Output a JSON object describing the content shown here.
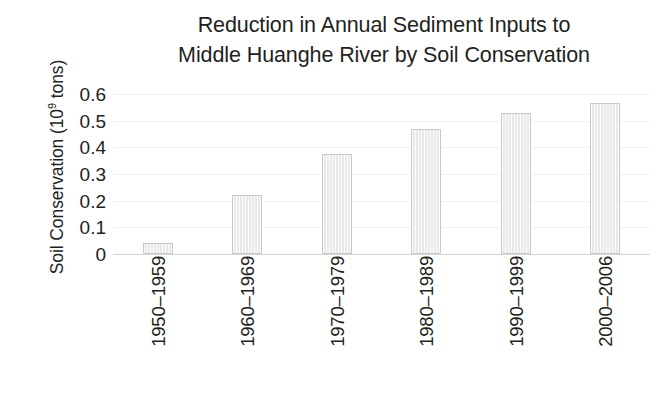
{
  "chart_data": {
    "type": "bar",
    "title": "Reduction in Annual Sediment Inputs to\nMiddle Huanghe River by Soil Conservation",
    "xlabel": "",
    "ylabel": "Soil Conservation (10⁹ tons)",
    "ylabel_prefix": "Soil Conservation (10",
    "ylabel_exponent": "9",
    "ylabel_suffix": " tons)",
    "categories": [
      "1950–1959",
      "1960–1969",
      "1970–1979",
      "1980–1989",
      "1990–1999",
      "2000–2006"
    ],
    "values": [
      0.04,
      0.22,
      0.375,
      0.47,
      0.53,
      0.565
    ],
    "ylim": [
      0,
      0.6
    ],
    "ytick_values": [
      0.6,
      0.5,
      0.4,
      0.3,
      0.2,
      0.1,
      0
    ],
    "ytick_labels": [
      "0.6",
      "0.5",
      "0.4",
      "0.3",
      "0.2",
      "0.1",
      "0"
    ],
    "grid": true,
    "grid_axis": "y",
    "legend": false,
    "legend_position": "none",
    "bar_fill_color": "#e9e9e9",
    "bar_border_color": "#c9c9c9",
    "gridline_color": "#f1f1f1",
    "axis_line_color": "#d5d5d5",
    "text_color": "#231f20",
    "background_color": "#ffffff"
  }
}
